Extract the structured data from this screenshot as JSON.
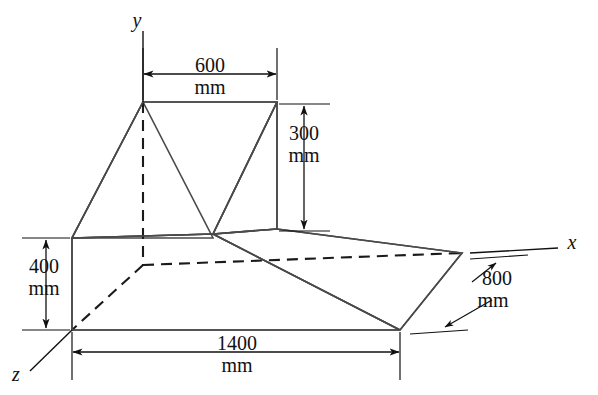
{
  "figure": {
    "units": "mm",
    "axes": [
      {
        "name": "y-axis",
        "label": "y"
      },
      {
        "name": "x-axis",
        "label": "x"
      },
      {
        "name": "z-axis",
        "label": "z"
      }
    ],
    "dimensions": [
      {
        "name": "width-600",
        "value": "600",
        "unit": "mm",
        "position": "top"
      },
      {
        "name": "height-300",
        "value": "300",
        "unit": "mm",
        "position": "upper-right"
      },
      {
        "name": "height-400",
        "value": "400",
        "unit": "mm",
        "position": "left"
      },
      {
        "name": "length-1400",
        "value": "1400",
        "unit": "mm",
        "position": "bottom"
      },
      {
        "name": "depth-800",
        "value": "800",
        "unit": "mm",
        "position": "lower-right"
      }
    ],
    "colors": {
      "top_face": "#d2d2d2",
      "left_face": "#c9c9c9",
      "front_face": "#c6c6c6",
      "wedge_face": "#cccccc",
      "wedge_side": "#c2c2c2",
      "dark_triangle": "#a8a8a8",
      "edge_stroke": "#4a4a4a",
      "hidden_stroke": "#1a1a1a",
      "background": "#ffffff"
    }
  },
  "labels": {
    "y": "y",
    "x": "x",
    "z": "z",
    "d600_value": "600",
    "d600_unit": "mm",
    "d300_value": "300",
    "d300_unit": "mm",
    "d400_value": "400",
    "d400_unit": "mm",
    "d1400_value": "1400",
    "d1400_unit": "mm",
    "d800_value": "800",
    "d800_unit": "mm"
  }
}
